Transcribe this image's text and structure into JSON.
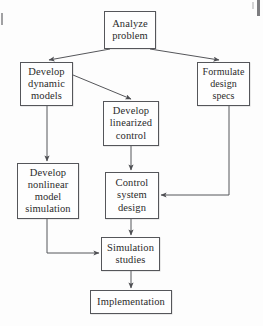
{
  "diagram": {
    "stroke_color": "#55565a",
    "text_color": "#2b2b2b",
    "background_color": "#fdfdfd",
    "nodes": [
      {
        "id": "analyze-problem",
        "name": "analyze-problem",
        "lines": [
          "Analyze",
          "problem"
        ],
        "x": 104,
        "y": 11,
        "w": 52,
        "h": 38
      },
      {
        "id": "develop-dynamic-models",
        "name": "develop-dynamic-models",
        "lines": [
          "Develop",
          "dynamic",
          "models"
        ],
        "x": 20,
        "y": 62,
        "w": 53,
        "h": 44
      },
      {
        "id": "formulate-design-specs",
        "name": "formulate-design-specs",
        "lines": [
          "Formulate",
          "design",
          "specs"
        ],
        "x": 197,
        "y": 62,
        "w": 53,
        "h": 44
      },
      {
        "id": "develop-linearized-control",
        "name": "develop-linearized-control",
        "lines": [
          "Develop",
          "linearized",
          "control"
        ],
        "x": 103,
        "y": 101,
        "w": 56,
        "h": 45
      },
      {
        "id": "develop-nonlinear-model-simulation",
        "name": "develop-nonlinear-model-simulation",
        "lines": [
          "Develop",
          "nonlinear",
          "model",
          "simulation"
        ],
        "x": 17,
        "y": 163,
        "w": 62,
        "h": 56
      },
      {
        "id": "control-system-design",
        "name": "control-system-design",
        "lines": [
          "Control",
          "system",
          "design"
        ],
        "x": 105,
        "y": 172,
        "w": 54,
        "h": 47
      },
      {
        "id": "simulation-studies",
        "name": "simulation-studies",
        "lines": [
          "Simulation",
          "studies"
        ],
        "x": 101,
        "y": 237,
        "w": 59,
        "h": 34
      },
      {
        "id": "implementation",
        "name": "implementation",
        "lines": [
          "Implementation"
        ],
        "x": 90,
        "y": 290,
        "w": 82,
        "h": 24
      }
    ],
    "edges": [
      {
        "id": "analyze-to-dynamic",
        "from": "analyze-problem",
        "to": "develop-dynamic-models",
        "kind": "diagonal"
      },
      {
        "id": "analyze-to-formulate",
        "from": "analyze-problem",
        "to": "formulate-design-specs",
        "kind": "diagonal"
      },
      {
        "id": "dynamic-to-linearized",
        "from": "develop-dynamic-models",
        "to": "develop-linearized-control",
        "kind": "diagonal"
      },
      {
        "id": "dynamic-to-nonlinear",
        "from": "develop-dynamic-models",
        "to": "develop-nonlinear-model-simulation",
        "kind": "vertical"
      },
      {
        "id": "linearized-to-control",
        "from": "develop-linearized-control",
        "to": "control-system-design",
        "kind": "vertical"
      },
      {
        "id": "formulate-to-control",
        "from": "formulate-design-specs",
        "to": "control-system-design",
        "kind": "elbow"
      },
      {
        "id": "nonlinear-to-simulation",
        "from": "develop-nonlinear-model-simulation",
        "to": "simulation-studies",
        "kind": "elbow"
      },
      {
        "id": "control-to-simulation",
        "from": "control-system-design",
        "to": "simulation-studies",
        "kind": "vertical"
      },
      {
        "id": "simulation-to-implementation",
        "from": "simulation-studies",
        "to": "implementation",
        "kind": "vertical"
      }
    ]
  }
}
